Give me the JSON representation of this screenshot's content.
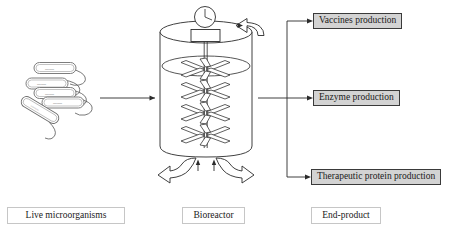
{
  "diagram": {
    "title_alt": "Bioreactor process flow: live microorganisms to end-products",
    "stages": [
      {
        "id": "microorganisms",
        "caption": "Live microorganisms"
      },
      {
        "id": "bioreactor",
        "caption": "Bioreactor"
      },
      {
        "id": "endproduct",
        "caption": "End-product"
      }
    ]
  },
  "products": [
    {
      "id": "vaccines",
      "label": "Vaccines production"
    },
    {
      "id": "enzyme",
      "label": "Enzyme production"
    },
    {
      "id": "therapeutic",
      "label": "Therapeutic protein production"
    }
  ],
  "bioreactor": {
    "parts": {
      "gauge": "gauge-dial",
      "motor": "motor-box",
      "shaft": "impeller-shaft",
      "impeller_count": 4,
      "feed_inlet": "curved-feed-arrow",
      "aeration_outlets": 2
    }
  },
  "microorganisms": {
    "cell_count": 5,
    "cell_shape": "rod-with-flagellum"
  },
  "colors": {
    "product_box_fill": "#d3d3d3",
    "product_box_border": "#3a3a3a",
    "caption_box_border": "#c6c6c6",
    "line": "#2b2b2b",
    "cell_outline": "#6e6e6e",
    "background": "#ffffff"
  }
}
